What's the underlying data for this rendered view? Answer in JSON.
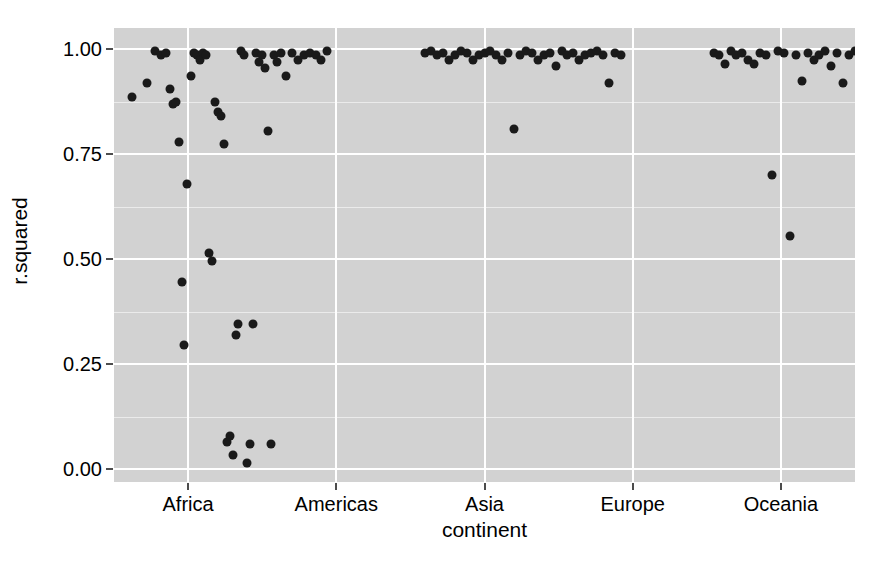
{
  "chart_data": {
    "type": "scatter",
    "title": "",
    "xlabel": "continent",
    "ylabel": "r.squared",
    "categories": [
      "Africa",
      "Americas",
      "Asia",
      "Europe",
      "Oceania"
    ],
    "xtick_labels": [
      "Africa",
      "Americas",
      "Asia",
      "Europe",
      "Oceania"
    ],
    "ytick_labels": [
      "0.00",
      "0.25",
      "0.50",
      "0.75",
      "1.00"
    ],
    "ytick_values": [
      0.0,
      0.25,
      0.5,
      0.75,
      1.0
    ],
    "ylim": [
      -0.03,
      1.05
    ],
    "grid": true,
    "legend": "none",
    "panel_background": "#d2d2d2",
    "gridline_color": "#ffffff",
    "point_color": "#1a1a1a",
    "series": [
      {
        "name": "Africa",
        "points": [
          {
            "x": 0.62,
            "y": 0.885
          },
          {
            "x": 0.72,
            "y": 0.92
          },
          {
            "x": 0.78,
            "y": 0.995
          },
          {
            "x": 0.82,
            "y": 0.985
          },
          {
            "x": 0.85,
            "y": 0.99
          },
          {
            "x": 0.88,
            "y": 0.905
          },
          {
            "x": 0.9,
            "y": 0.87
          },
          {
            "x": 0.92,
            "y": 0.875
          },
          {
            "x": 0.94,
            "y": 0.78
          },
          {
            "x": 0.96,
            "y": 0.445
          },
          {
            "x": 0.97,
            "y": 0.295
          },
          {
            "x": 0.99,
            "y": 0.68
          },
          {
            "x": 1.02,
            "y": 0.935
          },
          {
            "x": 1.04,
            "y": 0.99
          },
          {
            "x": 1.06,
            "y": 0.985
          },
          {
            "x": 1.08,
            "y": 0.975
          },
          {
            "x": 1.1,
            "y": 0.99
          },
          {
            "x": 1.12,
            "y": 0.985
          },
          {
            "x": 1.14,
            "y": 0.515
          },
          {
            "x": 1.16,
            "y": 0.495
          },
          {
            "x": 1.18,
            "y": 0.875
          },
          {
            "x": 1.2,
            "y": 0.85
          },
          {
            "x": 1.22,
            "y": 0.84
          },
          {
            "x": 1.24,
            "y": 0.775
          },
          {
            "x": 1.26,
            "y": 0.065
          },
          {
            "x": 1.28,
            "y": 0.08
          },
          {
            "x": 1.3,
            "y": 0.035
          },
          {
            "x": 1.32,
            "y": 0.32
          },
          {
            "x": 1.34,
            "y": 0.345
          },
          {
            "x": 1.36,
            "y": 0.995
          },
          {
            "x": 1.38,
            "y": 0.985
          },
          {
            "x": 1.4,
            "y": 0.015
          },
          {
            "x": 1.42,
            "y": 0.06
          },
          {
            "x": 1.44,
            "y": 0.345
          },
          {
            "x": 1.46,
            "y": 0.99
          },
          {
            "x": 1.48,
            "y": 0.97
          },
          {
            "x": 1.5,
            "y": 0.985
          },
          {
            "x": 1.52,
            "y": 0.955
          },
          {
            "x": 1.54,
            "y": 0.805
          },
          {
            "x": 1.56,
            "y": 0.06
          },
          {
            "x": 1.58,
            "y": 0.985
          },
          {
            "x": 1.6,
            "y": 0.97
          },
          {
            "x": 1.63,
            "y": 0.99
          },
          {
            "x": 1.66,
            "y": 0.935
          },
          {
            "x": 1.7,
            "y": 0.99
          },
          {
            "x": 1.74,
            "y": 0.975
          },
          {
            "x": 1.78,
            "y": 0.985
          },
          {
            "x": 1.82,
            "y": 0.99
          },
          {
            "x": 1.86,
            "y": 0.985
          },
          {
            "x": 1.9,
            "y": 0.975
          },
          {
            "x": 1.94,
            "y": 0.995
          }
        ]
      },
      {
        "name": "Americas",
        "points": [
          {
            "x": 2.6,
            "y": 0.99
          },
          {
            "x": 2.64,
            "y": 0.995
          },
          {
            "x": 2.68,
            "y": 0.985
          },
          {
            "x": 2.72,
            "y": 0.99
          },
          {
            "x": 2.76,
            "y": 0.975
          },
          {
            "x": 2.8,
            "y": 0.985
          },
          {
            "x": 2.84,
            "y": 0.995
          },
          {
            "x": 2.88,
            "y": 0.99
          },
          {
            "x": 2.92,
            "y": 0.975
          },
          {
            "x": 2.96,
            "y": 0.985
          },
          {
            "x": 3.0,
            "y": 0.99
          },
          {
            "x": 3.04,
            "y": 0.995
          },
          {
            "x": 3.08,
            "y": 0.985
          },
          {
            "x": 3.12,
            "y": 0.975
          },
          {
            "x": 3.16,
            "y": 0.99
          },
          {
            "x": 3.2,
            "y": 0.81
          },
          {
            "x": 3.24,
            "y": 0.985
          },
          {
            "x": 3.28,
            "y": 0.995
          },
          {
            "x": 3.32,
            "y": 0.99
          },
          {
            "x": 3.36,
            "y": 0.975
          },
          {
            "x": 3.4,
            "y": 0.985
          },
          {
            "x": 3.44,
            "y": 0.99
          },
          {
            "x": 3.48,
            "y": 0.96
          },
          {
            "x": 3.52,
            "y": 0.995
          },
          {
            "x": 3.56,
            "y": 0.985
          },
          {
            "x": 3.6,
            "y": 0.99
          },
          {
            "x": 3.64,
            "y": 0.975
          },
          {
            "x": 3.68,
            "y": 0.985
          },
          {
            "x": 3.72,
            "y": 0.99
          },
          {
            "x": 3.76,
            "y": 0.995
          },
          {
            "x": 3.8,
            "y": 0.985
          },
          {
            "x": 3.84,
            "y": 0.92
          },
          {
            "x": 3.88,
            "y": 0.99
          },
          {
            "x": 3.92,
            "y": 0.985
          }
        ]
      },
      {
        "name": "Asia",
        "points": [
          {
            "x": 4.55,
            "y": 0.99
          },
          {
            "x": 4.58,
            "y": 0.985
          },
          {
            "x": 4.62,
            "y": 0.965
          },
          {
            "x": 4.66,
            "y": 0.995
          },
          {
            "x": 4.7,
            "y": 0.985
          },
          {
            "x": 4.74,
            "y": 0.99
          },
          {
            "x": 4.78,
            "y": 0.975
          },
          {
            "x": 4.82,
            "y": 0.965
          },
          {
            "x": 4.86,
            "y": 0.99
          },
          {
            "x": 4.9,
            "y": 0.985
          },
          {
            "x": 4.94,
            "y": 0.7
          },
          {
            "x": 4.98,
            "y": 0.995
          },
          {
            "x": 5.02,
            "y": 0.99
          },
          {
            "x": 5.06,
            "y": 0.555
          },
          {
            "x": 5.1,
            "y": 0.985
          },
          {
            "x": 5.14,
            "y": 0.925
          },
          {
            "x": 5.18,
            "y": 0.99
          },
          {
            "x": 5.22,
            "y": 0.975
          },
          {
            "x": 5.26,
            "y": 0.985
          },
          {
            "x": 5.3,
            "y": 0.995
          },
          {
            "x": 5.34,
            "y": 0.96
          },
          {
            "x": 5.38,
            "y": 0.99
          },
          {
            "x": 5.42,
            "y": 0.92
          },
          {
            "x": 5.46,
            "y": 0.985
          },
          {
            "x": 5.5,
            "y": 0.995
          },
          {
            "x": 5.54,
            "y": 0.99
          },
          {
            "x": 5.58,
            "y": 0.975
          },
          {
            "x": 5.62,
            "y": 0.985
          },
          {
            "x": 5.66,
            "y": 0.93
          },
          {
            "x": 5.7,
            "y": 0.99
          },
          {
            "x": 5.74,
            "y": 0.985
          },
          {
            "x": 5.78,
            "y": 0.9
          },
          {
            "x": 5.82,
            "y": 0.99
          },
          {
            "x": 5.86,
            "y": 0.975
          },
          {
            "x": 5.9,
            "y": 0.985
          },
          {
            "x": 5.94,
            "y": 0.91
          },
          {
            "x": 5.98,
            "y": 0.995
          },
          {
            "x": 6.02,
            "y": 0.645
          },
          {
            "x": 6.06,
            "y": 0.99
          },
          {
            "x": 6.1,
            "y": 0.985
          },
          {
            "x": 6.14,
            "y": 0.905
          },
          {
            "x": 6.18,
            "y": 0.99
          },
          {
            "x": 6.22,
            "y": 0.975
          },
          {
            "x": 6.26,
            "y": 0.985
          },
          {
            "x": 6.3,
            "y": 0.555
          },
          {
            "x": 6.34,
            "y": 0.99
          }
        ]
      },
      {
        "name": "Europe",
        "points": [
          {
            "x": 6.62,
            "y": 0.985
          },
          {
            "x": 6.66,
            "y": 0.995
          },
          {
            "x": 6.7,
            "y": 0.99
          },
          {
            "x": 6.74,
            "y": 0.935
          },
          {
            "x": 6.78,
            "y": 0.925
          },
          {
            "x": 6.82,
            "y": 0.995
          },
          {
            "x": 6.86,
            "y": 0.99
          },
          {
            "x": 6.9,
            "y": 0.985
          },
          {
            "x": 6.94,
            "y": 0.995
          },
          {
            "x": 6.98,
            "y": 0.99
          },
          {
            "x": 7.02,
            "y": 0.985
          },
          {
            "x": 7.06,
            "y": 0.995
          },
          {
            "x": 7.1,
            "y": 0.99
          },
          {
            "x": 7.14,
            "y": 0.93
          },
          {
            "x": 7.18,
            "y": 0.8
          },
          {
            "x": 7.22,
            "y": 0.79
          },
          {
            "x": 7.26,
            "y": 0.995
          },
          {
            "x": 7.3,
            "y": 0.81
          },
          {
            "x": 7.34,
            "y": 0.99
          },
          {
            "x": 7.38,
            "y": 0.995
          }
        ]
      },
      {
        "name": "Oceania",
        "points": [
          {
            "x": 8.62,
            "y": 0.99
          },
          {
            "x": 8.62,
            "y": 0.965
          }
        ]
      }
    ]
  },
  "axis": {
    "y_title": "r.squared",
    "x_title": "continent"
  }
}
